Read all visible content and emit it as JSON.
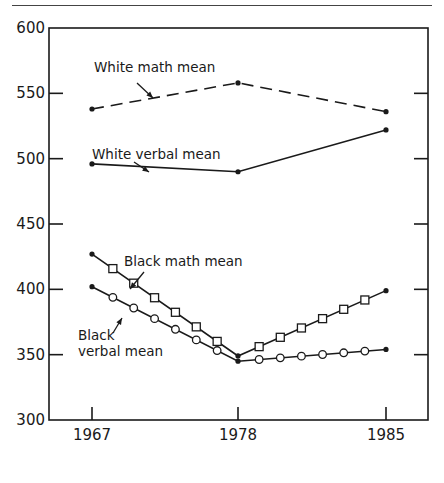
{
  "chart_data": {
    "type": "line",
    "title": "",
    "xlabel": "",
    "ylabel": "",
    "x": [
      1967,
      1978,
      1985
    ],
    "x_tick_labels": [
      "1967",
      "1978",
      "1985"
    ],
    "y_tick_labels": [
      "600",
      "550",
      "500",
      "450",
      "400",
      "350",
      "300"
    ],
    "ylim": [
      300,
      600
    ],
    "grid": false,
    "legend": "none (inline annotations with arrows)",
    "series": [
      {
        "name": "White math mean",
        "values": [
          538,
          558,
          536
        ],
        "style": "dashed",
        "marker": "dot"
      },
      {
        "name": "White verbal mean",
        "values": [
          496,
          490,
          522
        ],
        "style": "solid",
        "marker": "dot"
      },
      {
        "name": "Black math mean",
        "values": [
          427,
          349,
          399
        ],
        "style": "solid",
        "marker": "open-square"
      },
      {
        "name": "Black verbal mean",
        "values": [
          402,
          345,
          354
        ],
        "style": "solid",
        "marker": "open-circle"
      }
    ],
    "annotations": [
      {
        "text": "White math mean",
        "target": "White math mean"
      },
      {
        "text": "White verbal mean",
        "target": "White verbal mean"
      },
      {
        "text": "Black math mean",
        "target": "Black math mean"
      },
      {
        "text": "Black",
        "target": "Black verbal mean"
      },
      {
        "text": "verbal mean",
        "target": "Black verbal mean"
      }
    ]
  }
}
